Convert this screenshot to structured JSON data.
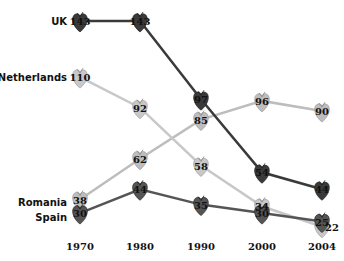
{
  "chart_data": {
    "type": "line",
    "title": "",
    "xlabel": "",
    "ylabel": "",
    "x": [
      "1970",
      "1980",
      "1990",
      "2000",
      "2004"
    ],
    "ylim": [
      22,
      143
    ],
    "grid": false,
    "legend": "inline-left",
    "series": [
      {
        "name": "UK",
        "color": "#3a3a3a",
        "values": [
          143,
          143,
          97,
          54,
          44
        ]
      },
      {
        "name": "Netherlands",
        "color": "#c8c8c8",
        "values": [
          110,
          92,
          58,
          34,
          22
        ]
      },
      {
        "name": "Romania",
        "color": "#bdbdbd",
        "values": [
          38,
          62,
          85,
          96,
          90
        ]
      },
      {
        "name": "Spain",
        "color": "#555555",
        "values": [
          30,
          44,
          35,
          30,
          25
        ]
      }
    ]
  }
}
